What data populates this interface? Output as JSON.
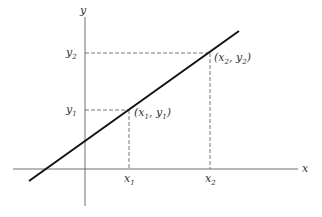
{
  "diagram": {
    "axes": {
      "x_label": "x",
      "y_label": "y",
      "color": "#707070"
    },
    "line": {
      "color": "#111111"
    },
    "points": [
      {
        "name": "P1",
        "label_x": "x",
        "label_sub": "1",
        "coord_label": "(x1, y1)",
        "x_tick": "x",
        "x_tick_sub": "1",
        "y_tick": "y",
        "y_tick_sub": "1"
      },
      {
        "name": "P2",
        "label_x": "x",
        "label_sub": "2",
        "coord_label": "(x2, y2)",
        "x_tick": "x",
        "x_tick_sub": "2",
        "y_tick": "y",
        "y_tick_sub": "2"
      }
    ],
    "text": {
      "p1_open": "(x",
      "p1_sub1": "1",
      "p1_mid": ", y",
      "p1_sub2": "1",
      "p1_close": ")",
      "p2_open": "(x",
      "p2_sub1": "2",
      "p2_mid": ", y",
      "p2_sub2": "2",
      "p2_close": ")",
      "x1_main": "x",
      "x1_sub": "1",
      "x2_main": "x",
      "x2_sub": "2",
      "y1_main": "y",
      "y1_sub": "1",
      "y2_main": "y",
      "y2_sub": "2"
    }
  }
}
